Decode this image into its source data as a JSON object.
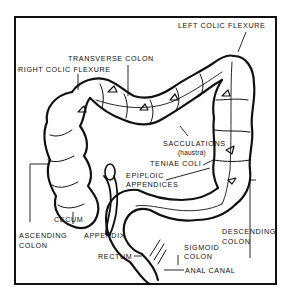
{
  "diagram": {
    "labels": {
      "left_colic_flexure": "LEFT COLIC FLEXURE",
      "transverse_colon": "TRANSVERSE COLON",
      "right_colic_flexure": "RIGHT COLIC FLEXURE",
      "sacculations": "SACCULATIONS",
      "haustra": "(haustra)",
      "teniae_coli": "TENIAE COLI",
      "epiploic_1": "EPIPLOIC",
      "epiploic_2": "APPENDICES",
      "descending_1": "DESCENDING",
      "descending_2": "COLON",
      "cecum": "CECUM",
      "ascending_1": "ASCENDING",
      "ascending_2": "COLON",
      "appendix": "APPENDIX",
      "sigmoid_1": "SIGMOID",
      "sigmoid_2": "COLON",
      "rectum": "RECTUM",
      "anal_canal": "ANAL CANAL"
    },
    "colors": {
      "ink": "#111111",
      "background": "#ffffff"
    }
  }
}
